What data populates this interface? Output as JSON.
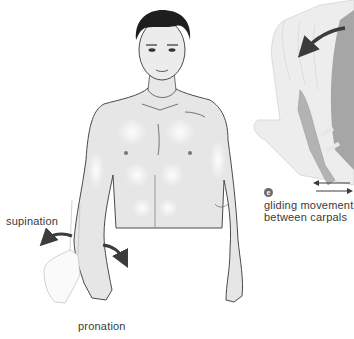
{
  "diagram": {
    "labels": {
      "supination": "supination",
      "pronation": "pronation",
      "gliding_line1": "gliding movement",
      "gliding_line2": "between carpals"
    },
    "badge": "e",
    "colors": {
      "skin": "#e6e6e6",
      "outline": "#4a4a4a",
      "hair": "#1e1e1e",
      "arrow": "#3c3c3c",
      "hand_ghost": "#ececec",
      "bone_dark": "#a9a9a9",
      "badge": "#6b6b6b"
    }
  }
}
